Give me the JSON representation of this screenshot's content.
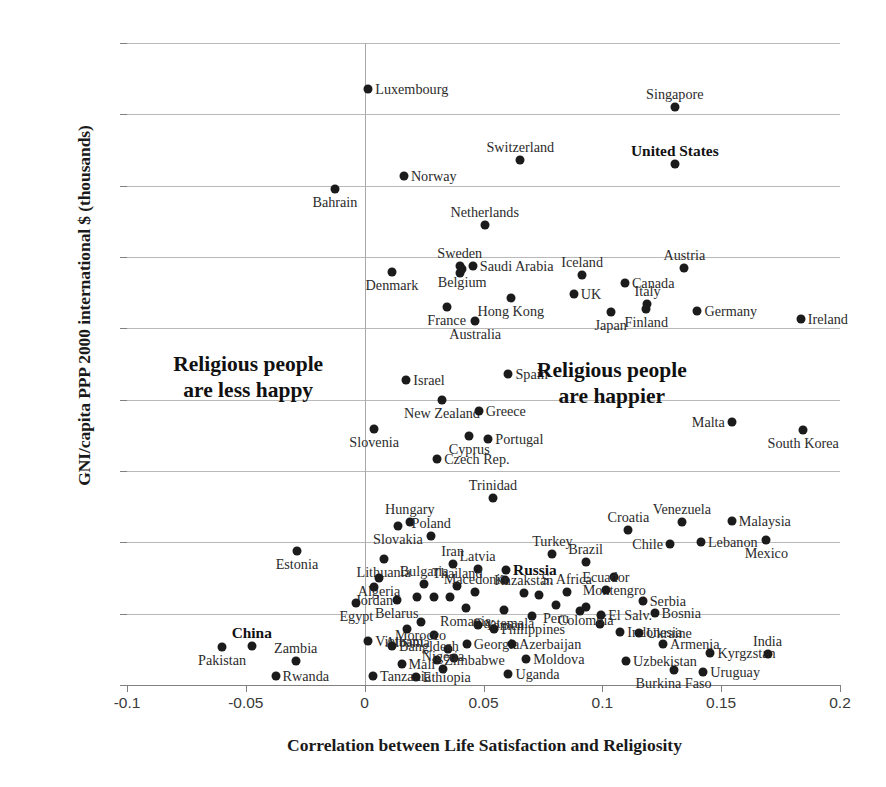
{
  "chart_data": {
    "type": "scatter",
    "title": "",
    "xlabel": "Correlation between Life Satisfaction and Religiosity",
    "ylabel": "GNI/capita PPP 2000 international $ (thousands)",
    "xlim": [
      -0.1,
      0.2
    ],
    "ylim": [
      0,
      45000
    ],
    "xticks": [
      "-0.1",
      "-0.05",
      "0",
      "0.05",
      "0.1",
      "0.15",
      "0.2"
    ],
    "xtick_values": [
      -0.1,
      -0.05,
      0,
      0.05,
      0.1,
      0.15,
      0.2
    ],
    "yticks": [
      "0",
      "5000",
      "10000",
      "15000",
      "20000",
      "25000",
      "30000",
      "35000",
      "40000",
      "45000"
    ],
    "ytick_values": [
      0,
      5000,
      10000,
      15000,
      20000,
      25000,
      30000,
      35000,
      40000,
      45000
    ],
    "grid": true,
    "legend": "none",
    "marker_color": "#1b1b1b",
    "annotations": [
      {
        "text": "Religious people\nare less happy",
        "x": -0.049,
        "y": 21600,
        "bold": true
      },
      {
        "text": "Religious people\nare happier",
        "x": 0.104,
        "y": 21200,
        "bold": true
      }
    ],
    "points": [
      {
        "label": "Luxembourg",
        "x": 0.0015,
        "y": 41750,
        "pos": "lr",
        "bold": false
      },
      {
        "label": "Singapore",
        "x": 0.1305,
        "y": 40500,
        "pos": "lt",
        "bold": false
      },
      {
        "label": "Switzerland",
        "x": 0.0655,
        "y": 36800,
        "pos": "lt",
        "bold": false
      },
      {
        "label": "United States",
        "x": 0.1305,
        "y": 36550,
        "pos": "lt",
        "bold": true
      },
      {
        "label": "Norway",
        "x": 0.0165,
        "y": 35650,
        "pos": "lr",
        "bold": false
      },
      {
        "label": "Bahrain",
        "x": -0.0125,
        "y": 34800,
        "pos": "lb",
        "bold": false
      },
      {
        "label": "Netherlands",
        "x": 0.0505,
        "y": 32250,
        "pos": "lt",
        "bold": false
      },
      {
        "label": "Sweden",
        "x": 0.04,
        "y": 29400,
        "pos": "lt",
        "bold": false
      },
      {
        "label": "Saudi Arabia",
        "x": 0.0455,
        "y": 29400,
        "pos": "lr",
        "bold": false
      },
      {
        "label": "Iceland",
        "x": 0.0915,
        "y": 28750,
        "pos": "lt",
        "bold": false
      },
      {
        "label": "Austria",
        "x": 0.1345,
        "y": 29250,
        "pos": "lt",
        "bold": false
      },
      {
        "label": "Denmark",
        "x": 0.0115,
        "y": 28950,
        "pos": "lb",
        "bold": false
      },
      {
        "label": "Belgium",
        "x": 0.041,
        "y": 29150,
        "pos": "lb",
        "bold": false
      },
      {
        "label": "Canada",
        "x": 0.1095,
        "y": 28150,
        "pos": "lr",
        "bold": false
      },
      {
        "label": "UK",
        "x": 0.088,
        "y": 27400,
        "pos": "lr",
        "bold": false
      },
      {
        "label": "France",
        "x": 0.0345,
        "y": 26500,
        "pos": "lb",
        "bold": false
      },
      {
        "label": "Hong Kong",
        "x": 0.0615,
        "y": 27150,
        "pos": "lb",
        "bold": false
      },
      {
        "label": "Italy",
        "x": 0.119,
        "y": 26700,
        "pos": "lt",
        "bold": false
      },
      {
        "label": "Japan",
        "x": 0.1035,
        "y": 26150,
        "pos": "lb",
        "bold": false
      },
      {
        "label": "Finland",
        "x": 0.1185,
        "y": 26350,
        "pos": "lb",
        "bold": false
      },
      {
        "label": "Germany",
        "x": 0.14,
        "y": 26200,
        "pos": "lr",
        "bold": false
      },
      {
        "label": "Ireland",
        "x": 0.1835,
        "y": 25650,
        "pos": "lr",
        "bold": false
      },
      {
        "label": "Australia",
        "x": 0.0465,
        "y": 25500,
        "pos": "lb",
        "bold": false
      },
      {
        "label": "Israel",
        "x": 0.0175,
        "y": 21350,
        "pos": "lr",
        "bold": false
      },
      {
        "label": "Spain",
        "x": 0.0605,
        "y": 21800,
        "pos": "lr",
        "bold": false
      },
      {
        "label": "New Zealand",
        "x": 0.0325,
        "y": 19950,
        "pos": "lb",
        "bold": false
      },
      {
        "label": "Greece",
        "x": 0.048,
        "y": 19200,
        "pos": "lr",
        "bold": false
      },
      {
        "label": "Malta",
        "x": 0.1545,
        "y": 18400,
        "pos": "ll",
        "bold": false
      },
      {
        "label": "South Korea",
        "x": 0.1845,
        "y": 17900,
        "pos": "lb",
        "bold": false
      },
      {
        "label": "Slovenia",
        "x": 0.004,
        "y": 17950,
        "pos": "lb",
        "bold": false
      },
      {
        "label": "Cyprus",
        "x": 0.044,
        "y": 17450,
        "pos": "lb",
        "bold": false
      },
      {
        "label": "Portugal",
        "x": 0.052,
        "y": 17250,
        "pos": "lr",
        "bold": false
      },
      {
        "label": "Czech Rep.",
        "x": 0.0305,
        "y": 15850,
        "pos": "lr",
        "bold": false
      },
      {
        "label": "Trinidad",
        "x": 0.054,
        "y": 13100,
        "pos": "lt",
        "bold": false
      },
      {
        "label": "Venezuela",
        "x": 0.1335,
        "y": 11400,
        "pos": "lt",
        "bold": false
      },
      {
        "label": "Malaysia",
        "x": 0.1545,
        "y": 11500,
        "pos": "lr",
        "bold": false
      },
      {
        "label": "Hungary",
        "x": 0.019,
        "y": 11400,
        "pos": "lt",
        "bold": false
      },
      {
        "label": "Croatia",
        "x": 0.111,
        "y": 10850,
        "pos": "lt",
        "bold": false
      },
      {
        "label": "Slovakia",
        "x": 0.014,
        "y": 11150,
        "pos": "lb",
        "bold": false
      },
      {
        "label": "Poland",
        "x": 0.028,
        "y": 10450,
        "pos": "lt",
        "bold": false
      },
      {
        "label": "Chile",
        "x": 0.1285,
        "y": 9850,
        "pos": "ll",
        "bold": false
      },
      {
        "label": "Lebanon",
        "x": 0.1415,
        "y": 10050,
        "pos": "lr",
        "bold": false
      },
      {
        "label": "Mexico",
        "x": 0.169,
        "y": 10150,
        "pos": "lb",
        "bold": false
      },
      {
        "label": "Estonia",
        "x": -0.0285,
        "y": 9400,
        "pos": "lb",
        "bold": false
      },
      {
        "label": "Lithuania",
        "x": 0.008,
        "y": 8800,
        "pos": "lb",
        "bold": false
      },
      {
        "label": "Iran",
        "x": 0.037,
        "y": 8500,
        "pos": "lt",
        "bold": false
      },
      {
        "label": "Turkey",
        "x": 0.079,
        "y": 9200,
        "pos": "lt",
        "bold": false
      },
      {
        "label": "Brazil",
        "x": 0.093,
        "y": 8600,
        "pos": "lt",
        "bold": false
      },
      {
        "label": "Latvia",
        "x": 0.0475,
        "y": 8100,
        "pos": "lt",
        "bold": false
      },
      {
        "label": "Algeria",
        "x": 0.006,
        "y": 7500,
        "pos": "lb",
        "bold": false
      },
      {
        "label": "Russia",
        "x": 0.0595,
        "y": 8050,
        "pos": "lr",
        "bold": true
      },
      {
        "label": "Montengro",
        "x": 0.105,
        "y": 7550,
        "pos": "lb",
        "bold": false
      },
      {
        "label": "Jordan",
        "x": 0.004,
        "y": 6850,
        "pos": "lb",
        "bold": false
      },
      {
        "label": "Bulgaria",
        "x": 0.025,
        "y": 7050,
        "pos": "lt",
        "bold": false
      },
      {
        "label": "Thailand",
        "x": 0.039,
        "y": 6950,
        "pos": "lt",
        "bold": false
      },
      {
        "label": "Macedonia",
        "x": 0.0465,
        "y": 6500,
        "pos": "lt",
        "bold": false
      },
      {
        "label": "Kazakstan",
        "x": 0.067,
        "y": 6450,
        "pos": "lt",
        "bold": false
      },
      {
        "label": "S. Africa",
        "x": 0.085,
        "y": 6500,
        "pos": "lt",
        "bold": false
      },
      {
        "label": "Ecuador",
        "x": 0.1015,
        "y": 6650,
        "pos": "lt",
        "bold": false
      },
      {
        "label": "Serbia",
        "x": 0.117,
        "y": 5900,
        "pos": "lr",
        "bold": false
      },
      {
        "label": "Egypt",
        "x": -0.0035,
        "y": 5750,
        "pos": "lb",
        "bold": false
      },
      {
        "label": "Belarus",
        "x": 0.0135,
        "y": 5950,
        "pos": "lb",
        "bold": false
      },
      {
        "label": "Peru",
        "x": 0.0805,
        "y": 5600,
        "pos": "lb",
        "bold": false
      },
      {
        "label": "Colombia",
        "x": 0.093,
        "y": 5500,
        "pos": "lb",
        "bold": false
      },
      {
        "label": "Romania",
        "x": 0.0425,
        "y": 5400,
        "pos": "lb",
        "bold": false
      },
      {
        "label": "Guatemala",
        "x": 0.0585,
        "y": 5250,
        "pos": "lb",
        "bold": false
      },
      {
        "label": "El Salv.",
        "x": 0.0995,
        "y": 4900,
        "pos": "lr",
        "bold": false
      },
      {
        "label": "Bosnia",
        "x": 0.122,
        "y": 5050,
        "pos": "lr",
        "bold": false
      },
      {
        "label": "Morocco",
        "x": 0.0235,
        "y": 4450,
        "pos": "lb",
        "bold": false
      },
      {
        "label": "Yemen",
        "x": 0.0475,
        "y": 4200,
        "pos": "lr",
        "bold": false
      },
      {
        "label": "Philippines",
        "x": 0.0545,
        "y": 3950,
        "pos": "lr",
        "bold": false
      },
      {
        "label": "Indonesia",
        "x": 0.1075,
        "y": 3750,
        "pos": "lr",
        "bold": false
      },
      {
        "label": "Ukraine",
        "x": 0.1155,
        "y": 3650,
        "pos": "lr",
        "bold": false
      },
      {
        "label": "Albania",
        "x": 0.018,
        "y": 3900,
        "pos": "lb",
        "bold": false
      },
      {
        "label": "Vietnam",
        "x": 0.0015,
        "y": 3100,
        "pos": "lr",
        "bold": false
      },
      {
        "label": "Bangldesh",
        "x": 0.0115,
        "y": 2750,
        "pos": "lr",
        "bold": false
      },
      {
        "label": "Georgia",
        "x": 0.043,
        "y": 2850,
        "pos": "lr",
        "bold": false
      },
      {
        "label": "Azerbaijan",
        "x": 0.062,
        "y": 2900,
        "pos": "lr",
        "bold": false
      },
      {
        "label": "Armenia",
        "x": 0.1255,
        "y": 2850,
        "pos": "lr",
        "bold": false
      },
      {
        "label": "Kyrgzstan",
        "x": 0.1455,
        "y": 2250,
        "pos": "lr",
        "bold": false
      },
      {
        "label": "India",
        "x": 0.1695,
        "y": 2150,
        "pos": "lt",
        "bold": false
      },
      {
        "label": "China",
        "x": -0.0475,
        "y": 2700,
        "pos": "lt",
        "bold": true
      },
      {
        "label": "Pakistan",
        "x": -0.06,
        "y": 2650,
        "pos": "lb",
        "bold": false
      },
      {
        "label": "Zambia",
        "x": -0.029,
        "y": 1700,
        "pos": "lt",
        "bold": false
      },
      {
        "label": "Zimbabwe",
        "x": 0.0305,
        "y": 1750,
        "pos": "lr",
        "bold": false
      },
      {
        "label": "Moldova",
        "x": 0.068,
        "y": 1800,
        "pos": "lr",
        "bold": false
      },
      {
        "label": "Uzbekistan",
        "x": 0.11,
        "y": 1700,
        "pos": "lr",
        "bold": false
      },
      {
        "label": "Mali",
        "x": 0.0155,
        "y": 1450,
        "pos": "lr",
        "bold": false
      },
      {
        "label": "Nigeria",
        "x": 0.033,
        "y": 1100,
        "pos": "lt",
        "bold": false
      },
      {
        "label": "Uganda",
        "x": 0.0605,
        "y": 800,
        "pos": "lr",
        "bold": false
      },
      {
        "label": "Burkina Faso",
        "x": 0.13,
        "y": 1050,
        "pos": "lb",
        "bold": false
      },
      {
        "label": "Uruguay",
        "x": 0.1425,
        "y": 900,
        "pos": "lr",
        "bold": false
      },
      {
        "label": "Tanzania",
        "x": 0.0035,
        "y": 650,
        "pos": "lr",
        "bold": false
      },
      {
        "label": "Ethiopia",
        "x": 0.0215,
        "y": 550,
        "pos": "lr",
        "bold": false
      },
      {
        "label": "Rwanda",
        "x": -0.0375,
        "y": 600,
        "pos": "lr",
        "bold": false
      }
    ],
    "extra_points": [
      {
        "x": 0.04,
        "y": 28900
      },
      {
        "x": 0.059,
        "y": 7350
      },
      {
        "x": 0.0735,
        "y": 6300
      },
      {
        "x": 0.029,
        "y": 6150
      },
      {
        "x": 0.036,
        "y": 6150
      },
      {
        "x": 0.022,
        "y": 6150
      },
      {
        "x": 0.0905,
        "y": 5200
      },
      {
        "x": 0.0705,
        "y": 4850
      },
      {
        "x": 0.099,
        "y": 4300
      },
      {
        "x": 0.029,
        "y": 3500
      },
      {
        "x": 0.035,
        "y": 2500
      },
      {
        "x": 0.0375,
        "y": 1900
      }
    ]
  }
}
